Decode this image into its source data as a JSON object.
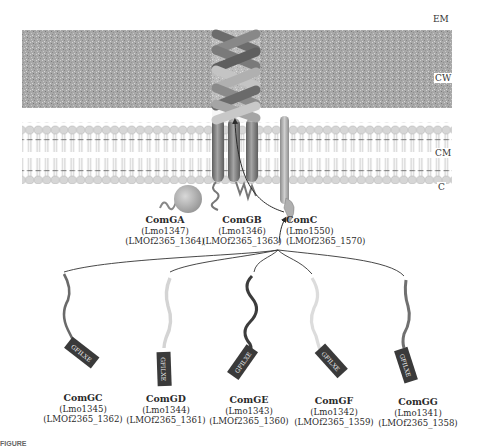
{
  "layers": {
    "em": "EM",
    "cw": "CW",
    "cm": "CM",
    "c": "C"
  },
  "motif_label": "GFILXE",
  "colors": {
    "cell_wall": "#a9a9a9",
    "membrane_head": "#cfcfcf",
    "membrane_tail": "#8a8a8a",
    "helix_dark": "#6e6e6e",
    "helix_light": "#bdbdbd",
    "arrow": "#2b2b2b",
    "motif_box": "#3a3a3a",
    "motif_text": "#f0f0f0"
  },
  "top_proteins": [
    {
      "name": "ComGA",
      "lmo": "(Lmo1347)",
      "lmof": "(LMOf2365_1364)"
    },
    {
      "name": "ComGB",
      "lmo": "(Lmo1346)",
      "lmof": "(LMOf2365_1363)"
    },
    {
      "name": "ComC",
      "lmo": "(Lmo1550)",
      "lmof": "(LMOf2365_1570)"
    }
  ],
  "pilins": [
    {
      "name": "ComGC",
      "lmo": "(Lmo1345)",
      "lmof": "(LMOf2365_1362)",
      "tail_color": "#6a6a6a"
    },
    {
      "name": "ComGD",
      "lmo": "(Lmo1344)",
      "lmof": "(LMOf2365_1361)",
      "tail_color": "#d4d4d4"
    },
    {
      "name": "ComGE",
      "lmo": "(Lmo1343)",
      "lmof": "(LMOf2365_1360)",
      "tail_color": "#3c3c3c"
    },
    {
      "name": "ComGF",
      "lmo": "(Lmo1342)",
      "lmof": "(LMOf2365_1359)",
      "tail_color": "#dcdcdc"
    },
    {
      "name": "ComGG",
      "lmo": "(Lmo1341)",
      "lmof": "(LMOf2365_1358)",
      "tail_color": "#707070"
    }
  ],
  "caption": "FIGURE"
}
